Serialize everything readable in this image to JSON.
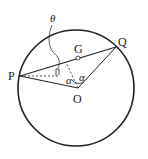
{
  "diagram": {
    "type": "geometry",
    "labels": {
      "P": "P",
      "Q": "Q",
      "O": "O",
      "G": "G",
      "theta": "θ",
      "alpha1": "α",
      "alpha2": "α"
    },
    "points": {
      "O": [
        78,
        88
      ],
      "P": [
        20,
        76
      ],
      "Q": [
        116,
        47
      ],
      "G": [
        78,
        58
      ],
      "M": [
        66,
        62
      ]
    },
    "circle": {
      "cx": 78,
      "cy": 88,
      "r": 60
    },
    "colors": {
      "stroke": "#222222",
      "background": "#ffffff"
    }
  }
}
